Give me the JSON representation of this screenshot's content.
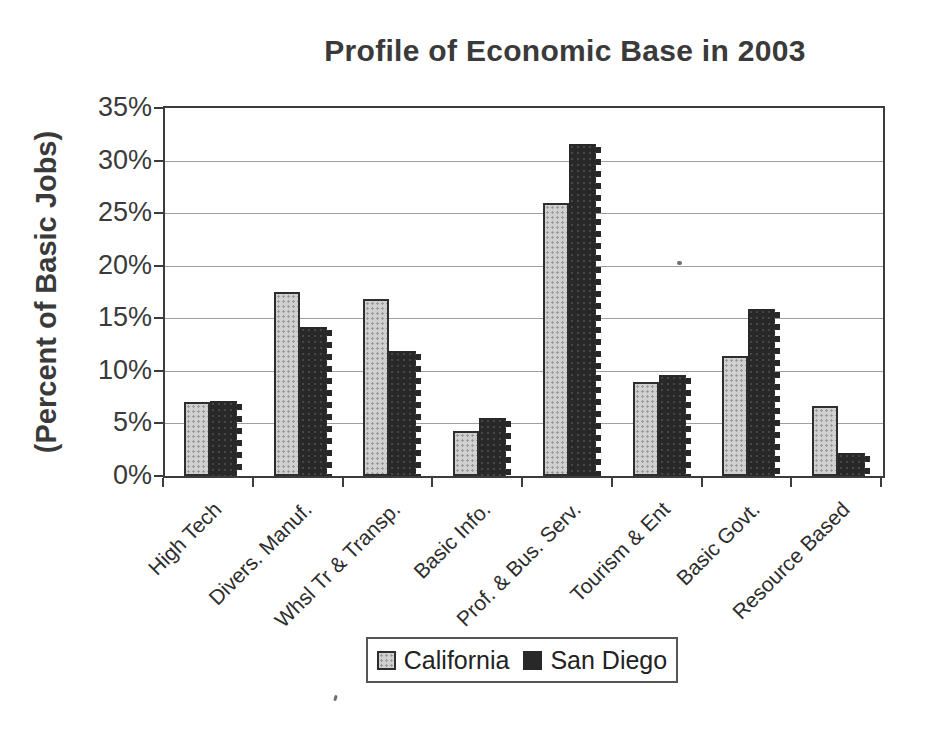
{
  "chart_data": {
    "type": "bar",
    "title": "Profile of Economic Base in 2003",
    "xlabel": "",
    "ylabel": "(Percent of Basic Jobs)",
    "categories": [
      "High Tech",
      "Divers. Manuf.",
      "Whsl Tr & Transp.",
      "Basic Info.",
      "Prof. & Bus. Serv.",
      "Tourism & Ent",
      "Basic Govt.",
      "Resource Based"
    ],
    "series": [
      {
        "name": "California",
        "color": "#d0d0d0",
        "values": [
          7.0,
          17.5,
          16.8,
          4.3,
          26.0,
          8.9,
          11.4,
          6.7
        ]
      },
      {
        "name": "San Diego",
        "color": "#282828",
        "values": [
          7.1,
          14.2,
          11.9,
          5.5,
          31.6,
          9.6,
          15.9,
          2.2
        ]
      }
    ],
    "ylim": [
      0,
      35
    ],
    "ytick_step": 5,
    "ytick_labels": [
      "0%",
      "5%",
      "10%",
      "15%",
      "20%",
      "25%",
      "30%",
      "35%"
    ],
    "grid": true,
    "legend_position": "bottom-center"
  }
}
